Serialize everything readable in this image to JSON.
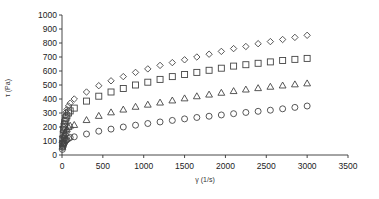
{
  "chart_data": {
    "type": "scatter",
    "title": "",
    "xlabel": "γ (1/s)",
    "ylabel": "τ (Pa)",
    "xlim": [
      0,
      3500
    ],
    "ylim": [
      0,
      1000
    ],
    "xticks": [
      0,
      500,
      1000,
      1500,
      2000,
      2500,
      3000,
      3500
    ],
    "yticks": [
      0,
      100,
      200,
      300,
      400,
      500,
      600,
      700,
      800,
      900,
      1000
    ],
    "grid": false,
    "legend": null,
    "series": [
      {
        "name": "diamond series",
        "marker": "diamond",
        "x": [
          5,
          10,
          15,
          20,
          25,
          30,
          40,
          50,
          60,
          80,
          100,
          150,
          300,
          450,
          600,
          750,
          900,
          1050,
          1200,
          1350,
          1500,
          1650,
          1800,
          1950,
          2100,
          2250,
          2400,
          2550,
          2700,
          2850,
          3000
        ],
        "y": [
          90,
          130,
          170,
          200,
          225,
          250,
          280,
          305,
          325,
          350,
          370,
          400,
          450,
          495,
          530,
          560,
          590,
          615,
          640,
          660,
          680,
          700,
          720,
          740,
          760,
          775,
          795,
          810,
          825,
          840,
          855
        ]
      },
      {
        "name": "square series",
        "marker": "square",
        "x": [
          5,
          10,
          15,
          20,
          25,
          30,
          40,
          50,
          60,
          80,
          100,
          150,
          300,
          450,
          600,
          750,
          900,
          1050,
          1200,
          1350,
          1500,
          1650,
          1800,
          1950,
          2100,
          2250,
          2400,
          2550,
          2700,
          2850,
          3000
        ],
        "y": [
          80,
          115,
          150,
          180,
          200,
          220,
          245,
          265,
          280,
          300,
          315,
          335,
          385,
          420,
          450,
          475,
          500,
          520,
          540,
          560,
          575,
          590,
          605,
          620,
          635,
          645,
          655,
          665,
          675,
          683,
          690
        ]
      },
      {
        "name": "triangle series",
        "marker": "triangle",
        "x": [
          5,
          10,
          15,
          20,
          25,
          30,
          40,
          50,
          60,
          80,
          100,
          150,
          300,
          450,
          600,
          750,
          900,
          1050,
          1200,
          1350,
          1500,
          1650,
          1800,
          1950,
          2100,
          2250,
          2400,
          2550,
          2700,
          2850,
          3000
        ],
        "y": [
          60,
          85,
          105,
          120,
          135,
          145,
          160,
          175,
          185,
          200,
          210,
          215,
          250,
          280,
          305,
          325,
          345,
          360,
          375,
          390,
          405,
          420,
          432,
          445,
          457,
          468,
          478,
          488,
          497,
          505,
          512
        ]
      },
      {
        "name": "circle series",
        "marker": "circle",
        "x": [
          5,
          10,
          15,
          20,
          25,
          30,
          40,
          50,
          60,
          80,
          100,
          150,
          300,
          450,
          600,
          750,
          900,
          1050,
          1200,
          1350,
          1500,
          1650,
          1800,
          1950,
          2100,
          2250,
          2400,
          2550,
          2700,
          2850,
          3000
        ],
        "y": [
          40,
          55,
          65,
          75,
          82,
          88,
          98,
          105,
          110,
          118,
          125,
          130,
          150,
          170,
          185,
          200,
          213,
          225,
          236,
          247,
          258,
          268,
          277,
          286,
          295,
          304,
          312,
          320,
          330,
          340,
          350
        ]
      }
    ]
  }
}
